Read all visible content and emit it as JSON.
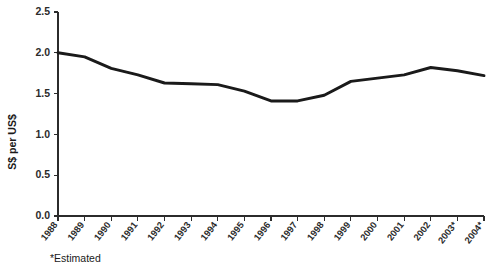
{
  "chart_data": {
    "type": "line",
    "title": "",
    "xlabel": "",
    "ylabel": "S$ per US$",
    "categories": [
      "1988",
      "1989",
      "1990",
      "1991",
      "1992",
      "1993",
      "1994",
      "1995",
      "1996",
      "1997",
      "1998",
      "1999",
      "2000",
      "2001",
      "2002",
      "2003*",
      "2004*"
    ],
    "values": [
      2.0,
      1.95,
      1.81,
      1.73,
      1.63,
      1.62,
      1.61,
      1.53,
      1.41,
      1.41,
      1.48,
      1.65,
      1.69,
      1.73,
      1.82,
      1.78,
      1.72
    ],
    "ylim": [
      0.0,
      2.5
    ],
    "yticks": [
      "0.0",
      "0.5",
      "1.0",
      "1.5",
      "2.0",
      "2.5"
    ],
    "ytick_values": [
      0.0,
      0.5,
      1.0,
      1.5,
      2.0,
      2.5
    ],
    "grid": false,
    "legend": "none",
    "line_color": "#1a1a1a",
    "axis_color": "#2b2b2b",
    "footnote": "*Estimated"
  }
}
